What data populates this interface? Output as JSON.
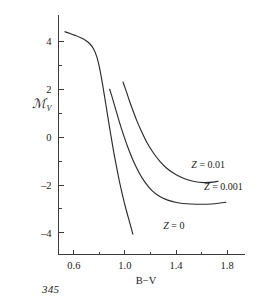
{
  "page": {
    "page_number": "345"
  },
  "chart_data": {
    "type": "line",
    "title": "",
    "xlabel": "B−V",
    "ylabel": "ℳ",
    "ylabel_subscript": "V",
    "xlim": [
      0.48,
      1.94
    ],
    "ylim": [
      5.1,
      -4.9
    ],
    "y_inverted": true,
    "grid": false,
    "legend": "inline-annotations",
    "x_ticks_major": [
      0.6,
      1.0,
      1.4,
      1.8
    ],
    "x_tick_labels": [
      "0.6",
      "1.0",
      "1.4",
      "1.8"
    ],
    "x_ticks_minor": [
      0.8,
      1.2,
      1.6
    ],
    "y_ticks_major": [
      -4,
      -2,
      0,
      2,
      4
    ],
    "y_tick_labels": [
      "–4",
      "–2",
      "0",
      "2",
      "4"
    ],
    "y_ticks_minor": [
      -3,
      -1,
      1,
      3
    ],
    "series": [
      {
        "name": "Z = 0",
        "label": "Z = 0",
        "label_x": 1.3,
        "label_y": -3.85,
        "points": [
          [
            0.53,
            4.4
          ],
          [
            0.57,
            4.33
          ],
          [
            0.61,
            4.25
          ],
          [
            0.65,
            4.16
          ],
          [
            0.69,
            4.05
          ],
          [
            0.725,
            3.9
          ],
          [
            0.755,
            3.68
          ],
          [
            0.78,
            3.35
          ],
          [
            0.8,
            2.92
          ],
          [
            0.818,
            2.42
          ],
          [
            0.835,
            1.88
          ],
          [
            0.852,
            1.32
          ],
          [
            0.87,
            0.72
          ],
          [
            0.89,
            0.08
          ],
          [
            0.91,
            -0.55
          ],
          [
            0.932,
            -1.18
          ],
          [
            0.955,
            -1.8
          ],
          [
            0.98,
            -2.4
          ],
          [
            1.008,
            -3.0
          ],
          [
            1.038,
            -3.58
          ],
          [
            1.062,
            -4.05
          ]
        ]
      },
      {
        "name": "Z = 0.001",
        "label": "Z = 0.001",
        "label_x": 1.62,
        "label_y": -2.22,
        "points": [
          [
            0.88,
            2.0
          ],
          [
            0.905,
            1.58
          ],
          [
            0.93,
            1.12
          ],
          [
            0.955,
            0.66
          ],
          [
            0.985,
            0.16
          ],
          [
            1.02,
            -0.38
          ],
          [
            1.06,
            -0.92
          ],
          [
            1.105,
            -1.42
          ],
          [
            1.155,
            -1.87
          ],
          [
            1.21,
            -2.22
          ],
          [
            1.27,
            -2.47
          ],
          [
            1.335,
            -2.63
          ],
          [
            1.405,
            -2.73
          ],
          [
            1.48,
            -2.78
          ],
          [
            1.56,
            -2.8
          ],
          [
            1.64,
            -2.8
          ],
          [
            1.72,
            -2.77
          ],
          [
            1.79,
            -2.72
          ]
        ]
      },
      {
        "name": "Z = 0.01",
        "label": "Z = 0.01",
        "label_x": 1.52,
        "label_y": -1.28,
        "points": [
          [
            0.985,
            2.3
          ],
          [
            1.01,
            1.92
          ],
          [
            1.035,
            1.52
          ],
          [
            1.062,
            1.12
          ],
          [
            1.092,
            0.7
          ],
          [
            1.128,
            0.26
          ],
          [
            1.17,
            -0.2
          ],
          [
            1.218,
            -0.62
          ],
          [
            1.272,
            -1.0
          ],
          [
            1.332,
            -1.32
          ],
          [
            1.398,
            -1.56
          ],
          [
            1.468,
            -1.74
          ],
          [
            1.542,
            -1.85
          ],
          [
            1.618,
            -1.9
          ],
          [
            1.69,
            -1.88
          ],
          [
            1.73,
            -1.84
          ]
        ]
      }
    ]
  }
}
